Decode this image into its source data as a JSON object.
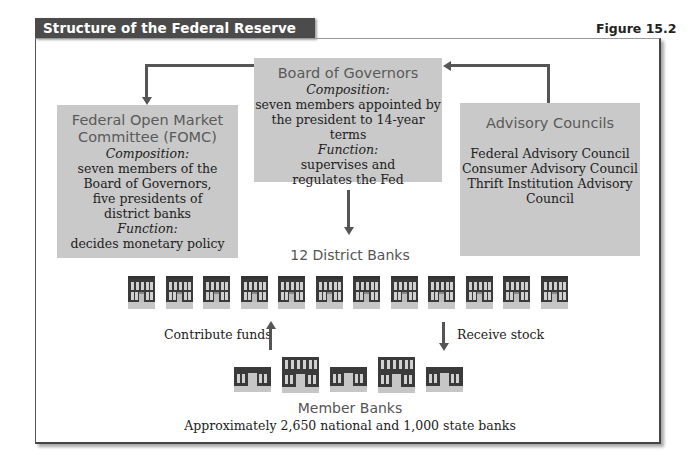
{
  "header": {
    "title": "Structure of the Federal Reserve System",
    "figure_label": "Figure 15.2"
  },
  "board_of_governors": {
    "title": "Board of Governors",
    "composition_label": "Composition:",
    "composition_lines": [
      "seven members appointed by",
      "the president to 14-year terms"
    ],
    "function_label": "Function:",
    "function_lines": [
      "supervises and",
      "regulates the Fed"
    ]
  },
  "fomc": {
    "title_lines": [
      "Federal Open Market",
      "Committee (FOMC)"
    ],
    "composition_label": "Composition:",
    "composition_lines": [
      "seven members of the",
      "Board of Governors,",
      "five presidents of",
      "district banks"
    ],
    "function_label": "Function:",
    "function_lines": [
      "decides monetary policy"
    ]
  },
  "advisory_councils": {
    "title": "Advisory Councils",
    "lines": [
      "Federal Advisory Council",
      "Consumer Advisory Council",
      "Thrift Institution Advisory",
      "Council"
    ]
  },
  "district_banks": {
    "label": "12 District Banks",
    "count": 12
  },
  "flows": {
    "contribute": "Contribute funds",
    "receive": "Receive stock"
  },
  "member_banks": {
    "label": "Member Banks",
    "description": "Approximately 2,650 national and 1,000 state banks",
    "icon_count": 5
  },
  "colors": {
    "title_bar": "#4b4b4b",
    "box_fill": "#c9c9c9",
    "arrow": "#555555",
    "heading_text": "#5a5a5a"
  }
}
